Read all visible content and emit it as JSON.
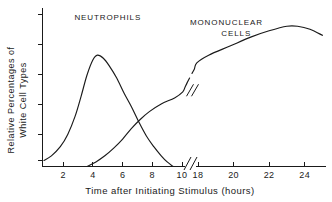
{
  "chart_data": {
    "type": "line",
    "title": "",
    "xlabel": "Time after Initiating Stimulus   (hours)",
    "ylabel_line1": "Relative Percentages of",
    "ylabel_line2": "White Cell Types",
    "xlim": [
      0.6,
      25.2
    ],
    "ylim": [
      0,
      100
    ],
    "x_ticks": [
      2,
      4,
      6,
      8,
      10,
      18,
      20,
      22,
      24
    ],
    "x_tick_labels": [
      "2",
      "4",
      "6",
      "8",
      "10",
      "18",
      "20",
      "22",
      "24"
    ],
    "y_ticks_count": 6,
    "y_tick_labels": [],
    "grid": false,
    "legend_position": "inline-annotation",
    "axis_break": {
      "present": true,
      "between": [
        10,
        18
      ],
      "style": "double-slash"
    },
    "curve_break": {
      "present": true,
      "series": "Mononuclear Cells",
      "at_x": 14.0,
      "at_y": 50.0,
      "style": "double-slash"
    },
    "series": [
      {
        "name": "NEUTROPHILS",
        "label_x": 5.0,
        "label_y": 96,
        "points": [
          [
            0.7,
            4
          ],
          [
            1.2,
            7
          ],
          [
            1.8,
            13
          ],
          [
            2.3,
            21
          ],
          [
            2.8,
            33
          ],
          [
            3.2,
            46
          ],
          [
            3.6,
            60
          ],
          [
            4.0,
            70
          ],
          [
            4.3,
            73
          ],
          [
            4.7,
            71
          ],
          [
            5.1,
            66
          ],
          [
            5.6,
            58
          ],
          [
            6.1,
            48
          ],
          [
            6.6,
            39
          ],
          [
            7.1,
            29
          ],
          [
            7.6,
            20
          ],
          [
            8.1,
            13
          ],
          [
            8.6,
            7
          ],
          [
            9.0,
            3
          ],
          [
            9.4,
            0
          ]
        ]
      },
      {
        "name": "MONONUCLEAR CELLS",
        "label_x": 19.6,
        "label_y": 93,
        "points": [
          [
            3.6,
            0
          ],
          [
            4.2,
            3
          ],
          [
            4.8,
            7
          ],
          [
            5.4,
            12
          ],
          [
            6.0,
            18
          ],
          [
            6.6,
            25
          ],
          [
            7.2,
            31
          ],
          [
            7.8,
            36
          ],
          [
            8.6,
            41
          ],
          [
            9.5,
            45
          ],
          [
            10.4,
            49
          ],
          [
            11.5,
            52
          ],
          [
            12.6,
            55
          ],
          [
            13.8,
            58
          ],
          [
            15.0,
            61
          ],
          [
            16.2,
            64
          ],
          [
            17.4,
            68
          ],
          [
            18.6,
            73
          ],
          [
            19.8,
            79
          ],
          [
            21.0,
            85
          ],
          [
            22.0,
            89
          ],
          [
            23.0,
            92
          ],
          [
            23.6,
            92
          ],
          [
            24.3,
            90
          ],
          [
            25.0,
            86
          ]
        ]
      }
    ]
  },
  "annotations": {
    "neutrophils_label": "NEUTROPHILS",
    "mononuclear_label_line1": "MONONUCLEAR",
    "mononuclear_label_line2": "CELLS"
  },
  "colors": {
    "ink": "#1a1a1a",
    "background": "#ffffff"
  }
}
